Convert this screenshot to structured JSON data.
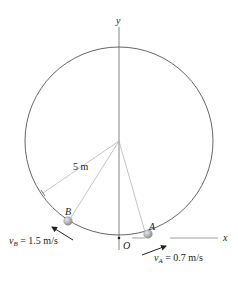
{
  "diagram": {
    "axes": {
      "x_label": "x",
      "y_label": "y",
      "origin_label": "O"
    },
    "radius_label": "5 m",
    "points": [
      {
        "name": "A",
        "velocity_symbol": "v",
        "velocity_sub": "A",
        "velocity_value": "= 0.7 m/s"
      },
      {
        "name": "B",
        "velocity_symbol": "v",
        "velocity_sub": "B",
        "velocity_value": "= 1.5 m/s"
      }
    ],
    "colors": {
      "line": "#555555",
      "ball": "#a8a8a8",
      "text": "#222222"
    }
  }
}
